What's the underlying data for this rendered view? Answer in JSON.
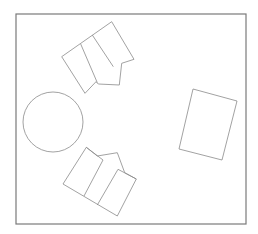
{
  "diagram": {
    "type": "floor-plan",
    "width": 258,
    "height": 234,
    "colors": {
      "background": "#ffffff",
      "frame_stroke": "#7a7a7a",
      "shape_stroke": "#8a8a8a"
    },
    "room_frame": {
      "x": 16,
      "y": 14,
      "width": 230,
      "height": 210
    },
    "round_table": {
      "cx": 53,
      "cy": 122,
      "r": 30
    },
    "rect_table": {
      "points": "193,89 237,101 222,160 179,149"
    },
    "chair_group_top": {
      "outline": "61.7,56.7 111.7,21.7 134,59.3 121.7,63.3 119.3,85 98.3,84 96,81.7 85,93.3",
      "divider_1": "80.7,44 97.3,82.7",
      "divider_2": "92.3,35 113.3,66.7",
      "notch": "113.3,66.7 121.7,63.3"
    },
    "chair_group_bottom": {
      "outline": "86.3,147.3 97.3,156 117.3,152.7 124.7,172.7 136.3,179 117.3,216 63,184",
      "divider_1": "103,160 84,196",
      "divider_2": "118,169.3 97.3,205",
      "left_panel_top": "86.3,147.3 103,160",
      "right_panel_top": "118,169.3 136.3,179"
    }
  }
}
